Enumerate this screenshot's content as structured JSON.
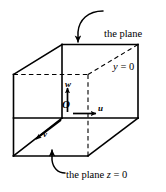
{
  "figure": {
    "type": "3d-cube-coordinate-diagram",
    "background_color": "#ffffff",
    "stroke_color": "#000000",
    "axes": {
      "origin_label": "O",
      "u_label": "u",
      "v_label": "v",
      "w_label": "w"
    },
    "callouts": {
      "plane_y": {
        "line1": "the plane",
        "var": "y",
        "eq": " = 0"
      },
      "plane_z": {
        "text_before": "the plane ",
        "var": "z",
        "eq": " = 0"
      }
    }
  }
}
